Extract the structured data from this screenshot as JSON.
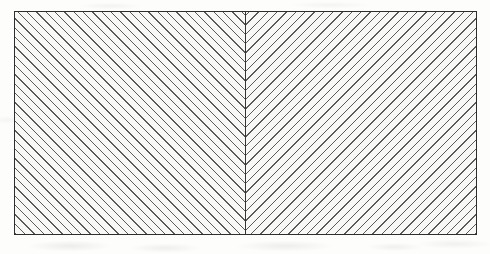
{
  "figure": {
    "title": "Hatched rectangle divided into two mirrored hatch regions",
    "caption": "",
    "background_color": "#fdfdfc",
    "canvas": {
      "width": 490,
      "height": 254
    },
    "frame": {
      "x": 14,
      "y": 11,
      "width": 463,
      "height": 224,
      "border_color": "#2e2e2e",
      "border_width": 1,
      "fill_color": "#f8f8f6"
    },
    "divider": {
      "label": "center-divider",
      "orientation": "vertical",
      "x": 245,
      "color": "#343434",
      "width": 1
    },
    "hatch": {
      "line_color": "#5a5a5a",
      "line_width": 1.15,
      "spacing": 6.6,
      "angle_degrees": 45
    },
    "regions": [
      {
        "name": "left-hatch-region",
        "direction": "up",
        "direction_label": "forward-slash",
        "angle_degrees": 45,
        "x": 14,
        "width": 231
      },
      {
        "name": "right-hatch-region",
        "direction": "down",
        "direction_label": "back-slash",
        "angle_degrees": -45,
        "x": 245,
        "width": 232
      }
    ]
  }
}
